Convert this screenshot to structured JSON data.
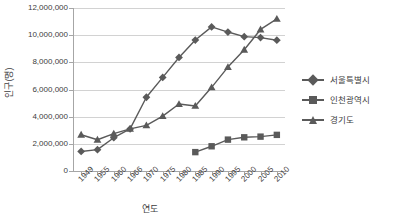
{
  "chart_data": {
    "type": "line",
    "title": "",
    "xlabel": "연도",
    "ylabel": "인구(명)",
    "categories": [
      "1949",
      "1955",
      "1960",
      "1966",
      "1970",
      "1975",
      "1980",
      "1985",
      "1990",
      "1995",
      "2000",
      "2005",
      "2010"
    ],
    "ylim": [
      0,
      12000000
    ],
    "ytick_values": [
      0,
      2000000,
      4000000,
      6000000,
      8000000,
      10000000,
      12000000
    ],
    "ytick_labels": [
      "0",
      "2,000,000",
      "4,000,000",
      "6,000,000",
      "8,000,000",
      "10,000,000",
      "12,000,000"
    ],
    "grid": true,
    "legend_position": "right",
    "series": [
      {
        "name": "서울특별시",
        "marker": "diamond",
        "color": "#5a5a5a",
        "values": [
          1440000,
          1570000,
          2450000,
          3100000,
          5430000,
          6890000,
          8360000,
          9640000,
          10610000,
          10230000,
          9890000,
          9820000,
          9630000
        ]
      },
      {
        "name": "인천광역시",
        "marker": "square",
        "color": "#5a5a5a",
        "values": [
          null,
          null,
          null,
          null,
          null,
          null,
          null,
          1390000,
          1820000,
          2310000,
          2480000,
          2530000,
          2660000
        ]
      },
      {
        "name": "경기도",
        "marker": "triangle",
        "color": "#5a5a5a",
        "values": [
          2670000,
          2300000,
          2750000,
          3100000,
          3360000,
          4040000,
          4930000,
          4790000,
          6160000,
          7650000,
          8930000,
          10420000,
          11200000
        ]
      }
    ]
  },
  "legend": {
    "items": [
      {
        "label": "서울특별시",
        "marker": "diamond"
      },
      {
        "label": "인천광역시",
        "marker": "square"
      },
      {
        "label": "경기도",
        "marker": "triangle"
      }
    ]
  },
  "colors": {
    "series": "#5a5a5a",
    "grid": "#d2d2d2",
    "axis": "#a6a6a6",
    "text": "#3d3d3d"
  }
}
